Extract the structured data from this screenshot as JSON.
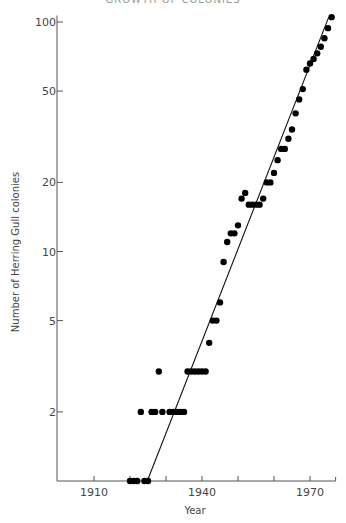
{
  "header": {
    "cropped_caption": "GROWTH OF COLONIES"
  },
  "chart_data": {
    "type": "scatter",
    "title": "",
    "xlabel": "Year",
    "ylabel": "Number of Herring Gull colonies",
    "yscale": "log",
    "xlim": [
      1907,
      1976
    ],
    "ylim": [
      1,
      110
    ],
    "x_ticks": [
      1910,
      1920,
      1930,
      1940,
      1950,
      1960,
      1970
    ],
    "x_tick_labels": [
      "1910",
      "",
      "",
      "1940",
      "",
      "",
      "1970"
    ],
    "y_ticks": [
      2,
      5,
      10,
      20,
      50,
      100
    ],
    "y_tick_labels": [
      "2",
      "5",
      "10",
      "20",
      "50",
      "100"
    ],
    "grid": false,
    "legend": null,
    "series": [
      {
        "name": "Observed colonies",
        "marker": "filled-circle",
        "points": [
          [
            1920,
            1
          ],
          [
            1921,
            1
          ],
          [
            1922,
            1
          ],
          [
            1924,
            1
          ],
          [
            1925,
            1
          ],
          [
            1923,
            2
          ],
          [
            1926,
            2
          ],
          [
            1927,
            2
          ],
          [
            1929,
            2
          ],
          [
            1931,
            2
          ],
          [
            1932,
            2
          ],
          [
            1933,
            2
          ],
          [
            1934,
            2
          ],
          [
            1935,
            2
          ],
          [
            1928,
            3
          ],
          [
            1936,
            3
          ],
          [
            1937,
            3
          ],
          [
            1938,
            3
          ],
          [
            1939,
            3
          ],
          [
            1940,
            3
          ],
          [
            1941,
            3
          ],
          [
            1942,
            4
          ],
          [
            1943,
            5
          ],
          [
            1944,
            5
          ],
          [
            1945,
            6
          ],
          [
            1946,
            9
          ],
          [
            1947,
            11
          ],
          [
            1948,
            12
          ],
          [
            1949,
            12
          ],
          [
            1950,
            13
          ],
          [
            1951,
            17
          ],
          [
            1952,
            18
          ],
          [
            1953,
            16
          ],
          [
            1954,
            16
          ],
          [
            1955,
            16
          ],
          [
            1956,
            16
          ],
          [
            1957,
            17
          ],
          [
            1958,
            20
          ],
          [
            1959,
            20
          ],
          [
            1960,
            22
          ],
          [
            1961,
            25
          ],
          [
            1962,
            28
          ],
          [
            1963,
            28
          ],
          [
            1964,
            31
          ],
          [
            1965,
            34
          ],
          [
            1966,
            40
          ],
          [
            1967,
            46
          ],
          [
            1968,
            51
          ],
          [
            1969,
            62
          ],
          [
            1970,
            66
          ],
          [
            1971,
            69
          ],
          [
            1972,
            73
          ],
          [
            1973,
            78
          ],
          [
            1974,
            85
          ],
          [
            1975,
            94
          ],
          [
            1976,
            105
          ]
        ]
      },
      {
        "name": "Fitted exponential trend",
        "type": "line",
        "points": [
          [
            1924.8,
            1
          ],
          [
            1975.2,
            105
          ]
        ]
      }
    ]
  }
}
